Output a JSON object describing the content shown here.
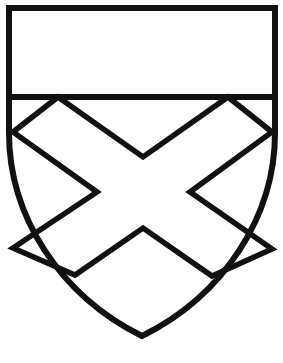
{
  "figure": {
    "kind": "heraldic-shield",
    "title": "Heraldic shield: a chief over a saltire",
    "background_color": "#ffffff",
    "ink_color": "#111111",
    "field_color": "#ffffff",
    "stroke_width": 5.5,
    "canvas": {
      "width": 283,
      "height": 363
    }
  },
  "shield": {
    "name": "escutcheon-outline",
    "description": "Shield outline with flat top, straight upper flanks and curved base meeting at a point",
    "path": "M 9 8 L 275 8 L 275 133 C 275 215 225 295 142 336 C 59 295 9 215 9 133 Z",
    "top_left": [
      9,
      8
    ],
    "top_right": [
      275,
      8
    ],
    "flank_end_y": 133,
    "base_point": [
      142,
      336
    ]
  },
  "charges": [
    {
      "name": "chief",
      "label": "Chief",
      "description": "Horizontal band across the top of the shield",
      "top_y": 8,
      "bottom_y": 97,
      "left_x": 9,
      "right_x": 275,
      "divider_path": "M 9 97 L 275 97"
    },
    {
      "name": "saltire",
      "label": "Saltire",
      "description": "Diagonal cross (X) filling the lower field beneath the chief",
      "path": "M 58 97 L 143 157 L 228 97 L 272 132 L 190 192 L 272 249 L 212 276 L 143 228 L 75 275 L 13 248 L 97 192 L 13 132 Z",
      "vertices": {
        "upper_left_on_chief": [
          58,
          97
        ],
        "upper_vertex": [
          143,
          157
        ],
        "upper_right_on_chief": [
          228,
          97
        ],
        "right_flank_upper": [
          272,
          132
        ],
        "right_inner_notch": [
          190,
          192
        ],
        "right_flank_lower": [
          272,
          249
        ],
        "lower_right_tip": [
          212,
          276
        ],
        "lower_vertex": [
          143,
          228
        ],
        "lower_left_tip": [
          75,
          275
        ],
        "left_flank_lower": [
          13,
          248
        ],
        "left_inner_notch": [
          97,
          192
        ],
        "left_flank_upper": [
          13,
          132
        ]
      }
    }
  ],
  "caption": {
    "text": "",
    "visible": false
  }
}
